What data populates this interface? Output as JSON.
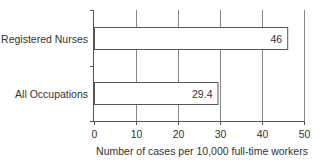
{
  "chart_data": {
    "type": "bar",
    "orientation": "horizontal",
    "title": "",
    "categories": [
      "Registered Nurses",
      "All Occupations"
    ],
    "values": [
      46,
      29.4
    ],
    "value_labels": [
      "46",
      "29.4"
    ],
    "xlabel": "Number of cases per 10,000 full-time workers",
    "ylabel": "",
    "xlim": [
      0,
      50
    ],
    "xticks": [
      0,
      10,
      20,
      30,
      40,
      50
    ],
    "xtick_labels": [
      "0",
      "10",
      "20",
      "30",
      "40",
      "50"
    ],
    "grid": {
      "vertical": true,
      "horizontal": false
    },
    "legend": null,
    "bar_fill": "#ffffff",
    "bar_stroke": "#555555",
    "grid_color": "#888888"
  }
}
